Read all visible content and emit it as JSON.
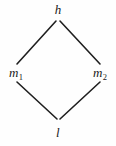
{
  "figure": {
    "kind": "hasse-diagram",
    "background_color": "#fefefe",
    "line_color": "#1f1f1f"
  },
  "nodes": {
    "top": {
      "label": "h"
    },
    "left": {
      "label": "m",
      "subscript": "1"
    },
    "right": {
      "label": "m",
      "subscript": "2"
    },
    "bottom": {
      "label": "l"
    }
  },
  "edges": [
    {
      "name": "top-to-left",
      "from": "h",
      "to": "m1",
      "x1": 56,
      "y1": 21,
      "x2": 17,
      "y2": 64
    },
    {
      "name": "top-to-right",
      "from": "h",
      "to": "m2",
      "x1": 60,
      "y1": 21,
      "x2": 100,
      "y2": 64
    },
    {
      "name": "left-to-bottom",
      "from": "m1",
      "to": "l",
      "x1": 17,
      "y1": 82,
      "x2": 57,
      "y2": 119
    },
    {
      "name": "right-to-bottom",
      "from": "m2",
      "to": "l",
      "x1": 100,
      "y1": 82,
      "x2": 60,
      "y2": 119
    }
  ]
}
